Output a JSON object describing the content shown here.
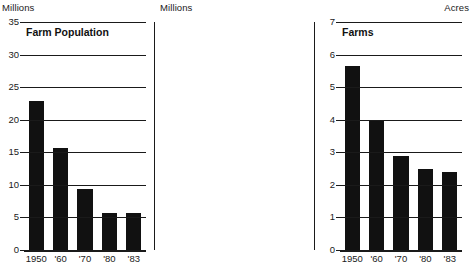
{
  "chart_data": [
    {
      "type": "bar",
      "title": "Farm Population",
      "unit_caption": "Millions",
      "unit_side": "left",
      "categories": [
        "1950",
        "'60",
        "'70",
        "'80",
        "'83"
      ],
      "values": [
        22.8,
        15.6,
        9.4,
        5.7,
        5.7
      ],
      "ylabel": "Millions",
      "xlabel": "",
      "ylim": [
        0,
        35
      ],
      "yticks": [
        0,
        5,
        10,
        15,
        20,
        25,
        30,
        35
      ],
      "ytick_labels": [
        "0",
        "5",
        "10",
        "15",
        "20",
        "25",
        "30",
        "35"
      ],
      "grid": true,
      "legend": "none",
      "bar_color": "#111111"
    },
    {
      "type": "bar",
      "title": "Farms",
      "unit_caption": "Millions",
      "unit_side": "left",
      "categories": [
        "1950",
        "'60",
        "'70",
        "'80",
        "'83"
      ],
      "values": [
        5.65,
        4.0,
        2.9,
        2.5,
        2.4
      ],
      "ylabel": "Millions",
      "xlabel": "",
      "ylim": [
        0,
        7
      ],
      "yticks": [
        0,
        1,
        2,
        3,
        4,
        5,
        6,
        7
      ],
      "ytick_labels": [
        "0",
        "1",
        "2",
        "3",
        "4",
        "5",
        "6",
        "7"
      ],
      "grid": true,
      "legend": "none",
      "bar_color": "#111111"
    },
    {
      "type": "bar",
      "title": "Average Farm Size",
      "unit_caption": "Acres",
      "unit_side": "right",
      "categories": [
        "1950",
        "'60",
        "'70",
        "'80",
        "'83"
      ],
      "values": [
        207,
        282,
        365,
        420,
        427
      ],
      "ylabel": "Acres",
      "xlabel": "",
      "ylim": [
        0,
        500
      ],
      "yticks": [
        0,
        100,
        200,
        300,
        400,
        500
      ],
      "ytick_labels": [
        "0",
        "100",
        "200",
        "300",
        "400",
        "500"
      ],
      "grid": true,
      "legend": "none",
      "bar_color": "#111111"
    }
  ]
}
